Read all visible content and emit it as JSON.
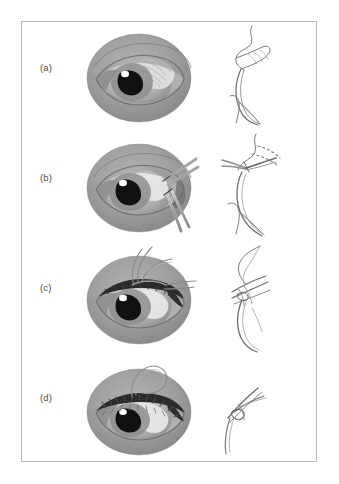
{
  "figure": {
    "domain_type": "medical-surgical-illustration",
    "title_text": "",
    "caption_text": "",
    "border_color": "#b9b9b9",
    "background_color": "#ffffff",
    "panel_count": 4,
    "panels": [
      {
        "label": "(a)",
        "view_front": "eye-open-with-upper-eyelid-lesion",
        "view_section": "eyelid-sagittal-cross-section-pretarsal",
        "stage": "pre-operative-appearance"
      },
      {
        "label": "(b)",
        "view_front": "eye-with-forceps-and-scissors-at-lateral-eyelid",
        "view_section": "eyelid-sagittal-cross-section-with-dotted-incision-line",
        "stage": "incision-and-dissection"
      },
      {
        "label": "(c)",
        "view_front": "eye-with-suture-needle-and-thread-through-eyelid-margin",
        "view_section": "eyelid-sagittal-cross-section-with-suture-pass",
        "stage": "suture-placement"
      },
      {
        "label": "(d)",
        "view_front": "eye-with-closed-running-sutures-along-eyelid-margin",
        "view_section": "eyelid-sagittal-cross-section-with-tied-sutures",
        "stage": "closure-complete"
      }
    ],
    "palette": {
      "skin_mid": "#9e9e9e",
      "skin_shadow": "#828282",
      "skin_light": "#b5b5b5",
      "sclera_light": "#e2e2e2",
      "iris_mid": "#8d8d8d",
      "pupil_dark": "#111111",
      "lid_margin_dark": "#2b2b2b",
      "line_ink": "#6d6d6d",
      "highlight_white": "#ffffff",
      "instrument_steel": "#c8c8c8"
    }
  }
}
